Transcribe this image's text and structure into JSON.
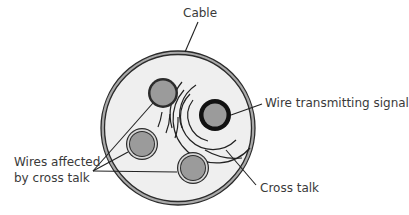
{
  "diagram": {
    "labels": {
      "cable": "Cable",
      "transmitting_wire": "Wire transmitting signal",
      "affected_wires_line1": "Wires affected",
      "affected_wires_line2": "by cross talk",
      "cross_talk": "Cross talk"
    },
    "colors": {
      "background": "#ffffff",
      "cable_interior": "#efefef",
      "cable_band": "#a9a9a9",
      "outline": "#2b2b2b",
      "wire_fill": "#9b9b9b",
      "wire_ring": "#d8d8d8",
      "signal_wire_ring": "#111111",
      "text": "#3a3a3a"
    },
    "cable": {
      "cx": 178,
      "cy": 128,
      "r": 76
    },
    "wires": [
      {
        "id": "top-left",
        "cx": 163,
        "cy": 93,
        "r": 15,
        "role": "affected"
      },
      {
        "id": "left",
        "cx": 142,
        "cy": 144,
        "r": 16,
        "role": "affected"
      },
      {
        "id": "bottom",
        "cx": 193,
        "cy": 168,
        "r": 16,
        "role": "affected"
      },
      {
        "id": "transmitting",
        "cx": 215,
        "cy": 115,
        "r": 16,
        "role": "transmitting"
      }
    ]
  }
}
